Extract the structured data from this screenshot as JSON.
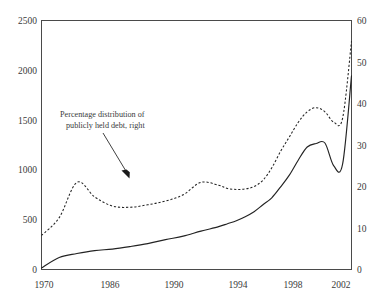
{
  "chart_data": {
    "type": "line",
    "title": "",
    "subtitle": "",
    "xlabel": "",
    "ylabel": "",
    "y2label": "",
    "grid": false,
    "legend_position": "none",
    "xlim": [
      1970,
      2005
    ],
    "ylim": [
      0,
      2500
    ],
    "y2lim": [
      0,
      60
    ],
    "xticks": [
      1970,
      1986,
      1990,
      1994,
      1998,
      2002
    ],
    "xticklabels": [
      "1970",
      "1986",
      "1990",
      "1994",
      "1998",
      "2002"
    ],
    "yticks": [
      0,
      500,
      1000,
      1500,
      2000,
      2500
    ],
    "yticklabels": [
      "0",
      "500",
      "1000",
      "1500",
      "2000",
      "2500"
    ],
    "y2ticks": [
      0,
      10,
      20,
      30,
      40,
      50,
      60
    ],
    "y2ticklabels": [
      "0",
      "10",
      "20",
      "30",
      "40",
      "50",
      "60"
    ],
    "annotations": [
      {
        "text_line1": "Percentage distribution of",
        "text_line2": "publicly held debt, right",
        "points_to_series": "Percentage distribution of publicly held debt"
      }
    ],
    "series": [
      {
        "name": "Foreign holdings of U.S. Treasury securities",
        "axis": "left",
        "style": "solid",
        "color": "#232323",
        "x": [
          1970,
          1972,
          1974,
          1976,
          1978,
          1980,
          1982,
          1984,
          1986,
          1988,
          1990,
          1991,
          1992,
          1993,
          1994,
          1995,
          1996,
          1997,
          1998,
          1999,
          2000,
          2001,
          2002,
          2003,
          2004,
          2005
        ],
        "values": [
          15,
          120,
          160,
          190,
          205,
          230,
          260,
          300,
          335,
          385,
          430,
          460,
          490,
          530,
          580,
          650,
          720,
          830,
          950,
          1100,
          1230,
          1265,
          1270,
          1040,
          1060,
          1945
        ]
      },
      {
        "name": "Percentage distribution of publicly held debt",
        "axis": "right",
        "style": "dashed",
        "color": "#232323",
        "x": [
          1970,
          1972,
          1974,
          1976,
          1978,
          1980,
          1982,
          1984,
          1986,
          1988,
          1990,
          1991,
          1992,
          1993,
          1994,
          1995,
          1996,
          1997,
          1998,
          1999,
          2000,
          2001,
          2002,
          2003,
          2004,
          2005
        ],
        "values": [
          8.2,
          12.5,
          21.0,
          17.5,
          15.3,
          15.0,
          15.6,
          16.5,
          18.0,
          21.0,
          20.3,
          19.5,
          19.3,
          19.4,
          20.0,
          21.5,
          24.5,
          28.5,
          32.0,
          35.5,
          38.0,
          39.0,
          38.0,
          35.5,
          36.5,
          55.0
        ]
      }
    ]
  },
  "axes": {
    "left_tick_labels": [
      "2500",
      "2000",
      "1500",
      "1000",
      "500",
      "0"
    ],
    "right_tick_labels": [
      "60",
      "50",
      "40",
      "30",
      "20",
      "10",
      "0"
    ],
    "bottom_tick_labels": [
      "1970",
      "1986",
      "1990",
      "1994",
      "1998",
      "2002"
    ]
  },
  "annotation": {
    "line1": "Percentage distribution of",
    "line2": "publicly held debt, right"
  }
}
